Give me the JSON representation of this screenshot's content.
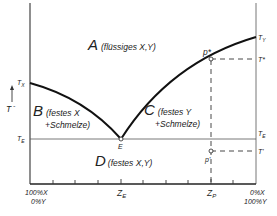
{
  "diagram": {
    "type": "eutectic phase diagram",
    "y_axis_label": "T",
    "regions": [
      {
        "id": "A",
        "letter": "A",
        "text": "(flüssiges X,Y)"
      },
      {
        "id": "B",
        "letter": "B",
        "text_line1": "(festes X",
        "text_line2": "+Schmelze)"
      },
      {
        "id": "C",
        "letter": "C",
        "text_line1": "(festes Y",
        "text_line2": "+Schmelze)"
      },
      {
        "id": "D",
        "letter": "D",
        "text": "(festes X,Y)"
      }
    ],
    "left_temps": {
      "tx": "T_X",
      "tx_main": "T",
      "tx_sub": "X",
      "te_main": "T",
      "te_sub": "E"
    },
    "right_temps": {
      "ty_main": "T",
      "ty_sub": "Y",
      "te_main": "T",
      "te_sub": "E",
      "tstar": "T*",
      "tprime": "T'"
    },
    "points": {
      "eutectic": "E",
      "p_star": "p*",
      "p_prime": "p'"
    },
    "x_axis": {
      "left_line1": "100%X",
      "left_line2": "0%Y",
      "right_line1": "0%X",
      "right_line2": "100%Y",
      "ze_main": "Z",
      "ze_sub": "E",
      "zp_main": "Z",
      "zp_sub": "P"
    },
    "colors": {
      "line": "#1a1a1a",
      "axis": "#333333",
      "text": "#222222",
      "background": "#ffffff"
    }
  }
}
